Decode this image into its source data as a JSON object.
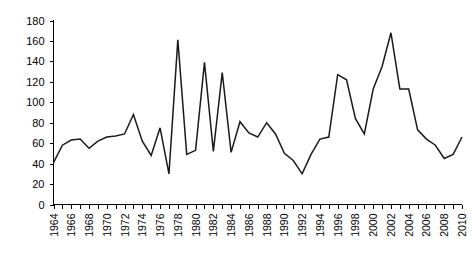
{
  "chart_data": {
    "type": "line",
    "title": "",
    "subtitle": "",
    "xlabel": "",
    "ylabel": "",
    "xlim": [
      1964,
      2010
    ],
    "ylim": [
      0,
      180
    ],
    "ytick_step": 20,
    "xtick_step": 1,
    "xtick_label_step": 2,
    "grid": false,
    "legend": false,
    "legend_position": "none",
    "line_color": "#1a1a1a",
    "background_color": "#ffffff",
    "axis_color": "#000000",
    "ytick_labels": [
      "0",
      "20",
      "40",
      "60",
      "80",
      "100",
      "120",
      "140",
      "160",
      "180"
    ],
    "ytick_values": [
      0,
      20,
      40,
      60,
      80,
      100,
      120,
      140,
      160,
      180
    ],
    "xtick_labels": [
      "1964",
      "1966",
      "1968",
      "1970",
      "1972",
      "1974",
      "1976",
      "1978",
      "1980",
      "1982",
      "1984",
      "1986",
      "1988",
      "1990",
      "1992",
      "1994",
      "1996",
      "1998",
      "2000",
      "2002",
      "2004",
      "2006",
      "2008",
      "2010"
    ],
    "x": [
      1964,
      1965,
      1966,
      1967,
      1968,
      1969,
      1970,
      1971,
      1972,
      1973,
      1974,
      1975,
      1976,
      1977,
      1978,
      1979,
      1980,
      1981,
      1982,
      1983,
      1984,
      1985,
      1986,
      1987,
      1988,
      1989,
      1990,
      1991,
      1992,
      1993,
      1994,
      1995,
      1996,
      1997,
      1998,
      1999,
      2000,
      2001,
      2002,
      2003,
      2004,
      2005,
      2006,
      2007,
      2008,
      2009,
      2010
    ],
    "values": [
      41,
      58,
      63,
      64,
      55,
      62,
      66,
      67,
      69,
      88,
      62,
      48,
      75,
      30,
      161,
      49,
      53,
      139,
      52,
      129,
      51,
      81,
      70,
      66,
      80,
      69,
      50,
      43,
      30,
      49,
      64,
      66,
      127,
      122,
      84,
      69,
      113,
      135,
      168,
      113,
      113,
      73,
      64,
      58,
      45,
      49,
      66
    ],
    "series": [
      {
        "name": "series-1",
        "values": [
          41,
          58,
          63,
          64,
          55,
          62,
          66,
          67,
          69,
          88,
          62,
          48,
          75,
          30,
          161,
          49,
          53,
          139,
          52,
          129,
          51,
          81,
          70,
          66,
          80,
          69,
          50,
          43,
          30,
          49,
          64,
          66,
          127,
          122,
          84,
          69,
          113,
          135,
          168,
          113,
          113,
          73,
          64,
          58,
          45,
          49,
          66
        ]
      }
    ]
  }
}
